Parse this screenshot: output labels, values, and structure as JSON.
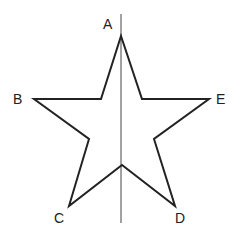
{
  "diagram": {
    "labels": {
      "A": "A",
      "B": "B",
      "C": "C",
      "D": "D",
      "E": "E"
    },
    "stroke_color": "#222222",
    "axis_color": "#444444"
  }
}
